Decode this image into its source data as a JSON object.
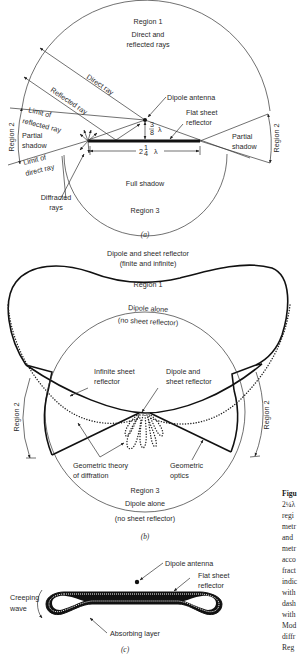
{
  "figure_a": {
    "region1": "Region 1",
    "direct_reflected_1": "Direct and",
    "direct_reflected_2": "reflected rays",
    "direct_ray": "Direct ray",
    "reflected_ray": "Reflected ray",
    "dipole_antenna": "Dipole antenna",
    "flat_sheet_1": "Flat sheet",
    "flat_sheet_2": "reflector",
    "limit_reflected_1": "Limit of",
    "limit_reflected_2": "reflected ray",
    "limit_direct_1": "Limit of",
    "limit_direct_2": "direct ray",
    "region2_left": "Region 2",
    "region2_right": "Region 2",
    "partial_shadow_left_1": "Partial",
    "partial_shadow_left_2": "shadow",
    "partial_shadow_right_1": "Partial",
    "partial_shadow_right_2": "shadow",
    "height_frac": "3/8 λ",
    "height_num": "3",
    "height_den": "8",
    "width_whole": "2",
    "width_num": "1",
    "width_den": "4",
    "lambda": "λ",
    "diffracted_1": "Diffracted",
    "diffracted_2": "rays",
    "full_shadow": "Full shadow",
    "region3": "Region 3",
    "caption": "(a)"
  },
  "figure_b": {
    "title_1": "Dipole and sheet reflector",
    "title_2": "(finite and infinite)",
    "region1": "Region 1",
    "dipole_alone_top_1": "Dipole alone",
    "dipole_alone_top_2": "(no sheet reflector)",
    "infinite_sheet_1": "Infinite sheet",
    "infinite_sheet_2": "reflector",
    "dipole_sheet_1": "Dipole and",
    "dipole_sheet_2": "sheet reflector",
    "region2_left": "Region 2",
    "region2_right": "Region 2",
    "gtd_1": "Geometric theory",
    "gtd_2": "of diffration",
    "go_1": "Geometric",
    "go_2": "optics",
    "region3": "Region 3",
    "dipole_alone_bottom_1": "Dipole alone",
    "dipole_alone_bottom_2": "(no sheet reflector)",
    "caption": "(b)"
  },
  "figure_c": {
    "dipole_antenna": "Dipole antenna",
    "flat_sheet_1": "Flat sheet",
    "flat_sheet_2": "reflector",
    "creeping_1": "Creeping",
    "creeping_2": "wave",
    "absorbing": "Absorbing layer",
    "caption": "(c)"
  },
  "side_caption": {
    "lines": [
      "Figu",
      "2¼λ",
      "regi",
      "metr",
      "and",
      "metr",
      "acco",
      "fract",
      "indic",
      "with",
      "dash",
      "with",
      "Mod",
      "diffr",
      "Reg"
    ]
  }
}
